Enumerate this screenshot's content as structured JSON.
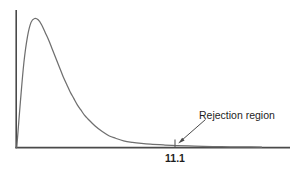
{
  "figure": {
    "name": "chi-square-rejection-region-figure",
    "background_color": "#ffffff",
    "axis_color": "#4a4a4a",
    "curve_color": "#6f6f6f",
    "text_color": "#1d1d1d"
  },
  "annotations": {
    "rejection_region_label": "Rejection region",
    "critical_value_label": "11.1"
  },
  "chart_data": {
    "type": "line",
    "title": "",
    "subtitle": "",
    "xlabel": "",
    "ylabel": "",
    "grid": false,
    "legend": false,
    "legend_position": "none",
    "axis_style": "left-spine-and-baseline",
    "xlim": [
      0,
      28
    ],
    "ylim": [
      0,
      1
    ],
    "x_tick_values": [
      11.1
    ],
    "x_tick_labels": [
      "11.1"
    ],
    "y_tick_values": [],
    "y_tick_labels": [],
    "annotations": [
      {
        "text": "Rejection region",
        "target_x": 11.1,
        "target_y": 0.02,
        "kind": "arrow-callout"
      }
    ],
    "series": [
      {
        "name": "density",
        "x": [
          0.0,
          0.4,
          0.8,
          1.2,
          1.6,
          2.0,
          2.4,
          2.8,
          3.2,
          3.6,
          4.0,
          4.4,
          4.8,
          5.2,
          5.6,
          6.0,
          6.4,
          6.8,
          7.2,
          7.6,
          8.0,
          8.8,
          9.6,
          10.4,
          11.1,
          12.0,
          13.0,
          14.0,
          15.0,
          16.5,
          18.0,
          20.0,
          22.0,
          24.0,
          26.0,
          27.5
        ],
        "y": [
          0.0,
          0.35,
          0.66,
          0.86,
          0.97,
          1.0,
          0.99,
          0.95,
          0.89,
          0.83,
          0.76,
          0.69,
          0.62,
          0.55,
          0.49,
          0.43,
          0.38,
          0.33,
          0.29,
          0.25,
          0.22,
          0.165,
          0.122,
          0.088,
          0.07,
          0.05,
          0.038,
          0.03,
          0.024,
          0.018,
          0.013,
          0.009,
          0.006,
          0.004,
          0.003,
          0.002
        ]
      }
    ]
  }
}
